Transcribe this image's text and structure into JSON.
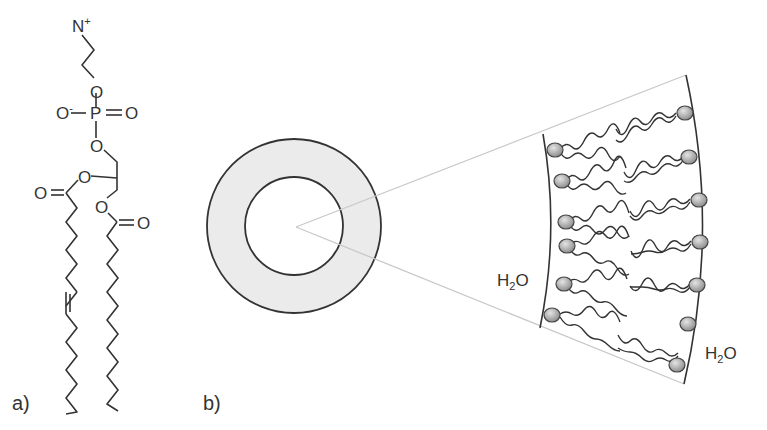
{
  "figure": {
    "panel_a": {
      "label": "a)",
      "description": "Phospholipid (phosphatidylethanolamine-type) structural formula",
      "atoms": {
        "nitrogen": "N",
        "nitrogen_charge": "+",
        "o_ether_top": "O",
        "o_minus": "O",
        "o_minus_charge": "-",
        "phosphorus": "P",
        "o_double": "O",
        "o_ester_phosphate": "O",
        "o_glycerol_mid": "O",
        "o_carbonyl_left": "O",
        "o_glycerol_low": "O",
        "o_carbonyl_right": "O"
      },
      "chains": [
        {
          "name": "unsaturated chain",
          "has_cis_double_bond": true
        },
        {
          "name": "saturated chain",
          "has_cis_double_bond": false
        }
      ]
    },
    "panel_b": {
      "label": "b)",
      "description": "Vesicle cross-section with zoomed bilayer segment",
      "water_inner": {
        "main": "H",
        "sub": "2",
        "tail": "O"
      },
      "water_outer": {
        "main": "H",
        "sub": "2",
        "tail": "O"
      },
      "colors": {
        "shell_fill": "#ebebeb",
        "line": "#333333",
        "zoom_lines": "#c8c8c8",
        "head_fill": "#a9a9a9"
      }
    }
  }
}
